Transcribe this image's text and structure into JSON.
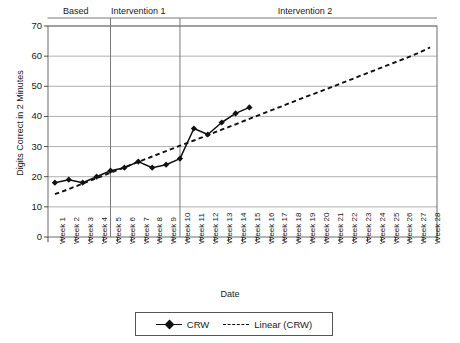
{
  "chart_data": {
    "type": "line",
    "title": "",
    "xlabel": "Date",
    "ylabel": "Digits Correct in 2 Minutes",
    "ylim": [
      0,
      70
    ],
    "ytick_step": 10,
    "yticks": [
      70,
      60,
      50,
      40,
      30,
      20,
      10,
      0
    ],
    "grid": true,
    "legend_position": "bottom",
    "categories": [
      "Week 1",
      "Week 2",
      "Week 3",
      "Week 4",
      "Week 5",
      "Week 6",
      "Week 7",
      "Week 8",
      "Week 9",
      "Week 10",
      "Week 11",
      "Week 12",
      "Week 13",
      "Week 14",
      "Week 15",
      "Week 16",
      "Week 17",
      "Week 18",
      "Week 19",
      "Week 20",
      "Week 21",
      "Week 22",
      "Week 23",
      "Week 24",
      "Week 25",
      "Week 26",
      "Week 27",
      "Week 28"
    ],
    "series": [
      {
        "name": "CRW",
        "style": "solid-diamond",
        "color": "#111111",
        "values": [
          18,
          19,
          18,
          20,
          22,
          23,
          25,
          23,
          24,
          26,
          36,
          34,
          38,
          41,
          43,
          null,
          null,
          null,
          null,
          null,
          null,
          null,
          null,
          null,
          null,
          null,
          null,
          null
        ]
      },
      {
        "name": "Linear (CRW)",
        "style": "dashed",
        "color": "#111111",
        "values": [
          14.2,
          15.9,
          17.7,
          19.5,
          21.3,
          23.1,
          24.9,
          26.7,
          28.5,
          30.3,
          32.0,
          33.8,
          35.6,
          37.4,
          39.2,
          41.0,
          42.8,
          44.6,
          46.4,
          48.1,
          49.9,
          51.7,
          53.5,
          55.3,
          57.1,
          58.9,
          60.7,
          62.9
        ]
      }
    ],
    "phases": [
      {
        "label": "Based",
        "start_week": 1,
        "end_week": 4
      },
      {
        "label": "Intervention 1",
        "start_week": 5,
        "end_week": 9
      },
      {
        "label": "Intervention 2",
        "start_week": 10,
        "end_week": 28
      }
    ],
    "phase_dividers": [
      4.5,
      9.5
    ]
  },
  "legend": {
    "entries": [
      {
        "label": "CRW"
      },
      {
        "label": "Linear (CRW)"
      }
    ]
  }
}
